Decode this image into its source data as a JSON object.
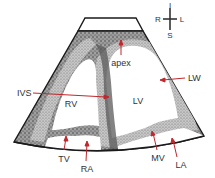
{
  "diagram": {
    "colors": {
      "background": "#ffffff",
      "sector_fill": "#8a8a8a",
      "tissue_dark": "#555555",
      "tissue_light": "#cfcfcf",
      "cavity": "#ffffff",
      "outline": "#1a1a1a",
      "arrow": "#c0282d",
      "text": "#333333"
    },
    "orientation": {
      "top": "I",
      "left": "R",
      "right": "L",
      "bottom": "S"
    },
    "labels": {
      "apex": "apex",
      "lw": "LW",
      "ivs": "IVS",
      "rv": "RV",
      "lv": "LV",
      "tv": "TV",
      "ra": "RA",
      "mv": "MV",
      "la": "LA"
    }
  }
}
